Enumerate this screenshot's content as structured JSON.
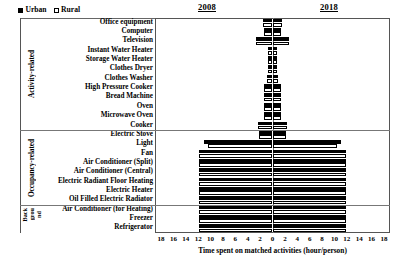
{
  "legend": {
    "entries": [
      {
        "label": "Urban",
        "style": "filled"
      },
      {
        "label": "Rural",
        "style": "hollow"
      }
    ]
  },
  "headers": {
    "left_year": "2008",
    "right_year": "2018"
  },
  "axis": {
    "title": "Time spent on matched activities (hour/person)",
    "ticks": [
      18,
      16,
      14,
      12,
      10,
      8,
      6,
      4,
      2,
      0,
      2,
      4,
      6,
      8,
      10,
      12,
      14,
      16,
      18
    ],
    "max": 18
  },
  "categories": [
    {
      "name": "Activity-related",
      "rows": 12,
      "stacked": false
    },
    {
      "name": "Occupancy-related",
      "rows": 8,
      "stacked": false
    },
    {
      "name": "Background",
      "rows": 2,
      "stacked": true,
      "stack_lines": [
        "Back",
        "grou",
        "nd"
      ]
    }
  ],
  "chart_data": {
    "type": "bar",
    "title": "",
    "xlabel": "Time spent on matched activities (hour/person)",
    "ylabel": "",
    "xlim": [
      -18,
      18
    ],
    "grid": false,
    "legend_position": "top-left",
    "orientation": "horizontal-diverging",
    "note": "Left half = year 2008, right half = year 2018; axis is mirrored so both halves read 0..18 outward from center.",
    "categories": [
      "Office equipment",
      "Computer",
      "Television",
      "Instant Water Heater",
      "Storage Water Heater",
      "Clothes Dryer",
      "Clothes Washer",
      "High Pressure Cooker",
      "Bread Machine",
      "Oven",
      "Microwave Oven",
      "Cooker",
      "Electric Stove",
      "Light",
      "Fan",
      "Air Conditioner (Split)",
      "Air Conditioner (Central)",
      "Electric Radiant Floor Heating",
      "Electric Heater",
      "Oil Filled Electric Radiator",
      "Air Conditioner (for Heating)",
      "Freezer",
      "Refrigerator"
    ],
    "series": [
      {
        "name": "2008 Urban",
        "year": "2008",
        "side": "left",
        "fill": "filled",
        "values": [
          1.5,
          1.4,
          2.6,
          0.8,
          0.8,
          0.8,
          0.9,
          1.3,
          1.3,
          1.3,
          1.3,
          2.4,
          2.1,
          11.0,
          11.9,
          11.9,
          11.9,
          11.9,
          11.9,
          11.9,
          11.9,
          11.9,
          11.9
        ]
      },
      {
        "name": "2008 Rural",
        "year": "2008",
        "side": "left",
        "fill": "hollow",
        "values": [
          1.5,
          1.4,
          2.6,
          0.8,
          0.8,
          0.8,
          0.9,
          1.3,
          1.3,
          1.3,
          1.3,
          2.4,
          2.1,
          10.4,
          11.9,
          11.9,
          11.9,
          11.9,
          11.9,
          11.9,
          11.9,
          11.9,
          11.9
        ]
      },
      {
        "name": "2018 Urban",
        "year": "2018",
        "side": "right",
        "fill": "filled",
        "values": [
          1.5,
          1.4,
          2.6,
          0.8,
          0.8,
          0.8,
          0.9,
          1.3,
          1.3,
          1.3,
          1.3,
          2.4,
          2.1,
          11.0,
          11.9,
          11.9,
          11.9,
          11.9,
          11.9,
          11.9,
          11.9,
          11.9,
          11.9
        ]
      },
      {
        "name": "2018 Rural",
        "year": "2018",
        "side": "right",
        "fill": "hollow",
        "values": [
          1.5,
          1.4,
          2.6,
          0.8,
          0.8,
          0.8,
          0.9,
          1.3,
          1.3,
          1.3,
          1.3,
          2.4,
          2.1,
          10.4,
          11.9,
          11.9,
          11.9,
          11.9,
          11.9,
          11.9,
          11.9,
          11.9,
          11.9
        ]
      }
    ]
  }
}
